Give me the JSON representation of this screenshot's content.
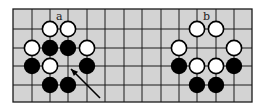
{
  "diagram": {
    "type": "go-board",
    "board": {
      "x0": 13,
      "y0": 9,
      "x1": 252,
      "y1": 102,
      "color": "#d3d3d3",
      "line_color": "#1a1a1a"
    },
    "vlines": [
      32,
      50,
      68,
      87,
      105,
      124,
      142,
      161,
      179,
      197,
      216,
      234
    ],
    "hlines": [
      29,
      48,
      66,
      85
    ],
    "labels": [
      {
        "text": "a",
        "x": 56,
        "y": 20
      },
      {
        "text": "b",
        "x": 203,
        "y": 20
      }
    ],
    "stones": {
      "white": [
        [
          50,
          29
        ],
        [
          68,
          29
        ],
        [
          32,
          48
        ],
        [
          87,
          48
        ],
        [
          50,
          66
        ],
        [
          197,
          29
        ],
        [
          216,
          29
        ],
        [
          179,
          48
        ],
        [
          234,
          48
        ],
        [
          197,
          66
        ],
        [
          216,
          66
        ]
      ],
      "black": [
        [
          50,
          48
        ],
        [
          68,
          48
        ],
        [
          32,
          66
        ],
        [
          87,
          66
        ],
        [
          50,
          85
        ],
        [
          68,
          85
        ],
        [
          179,
          66
        ],
        [
          234,
          66
        ],
        [
          197,
          85
        ],
        [
          216,
          85
        ]
      ]
    },
    "arrow": {
      "from": [
        100,
        98
      ],
      "to": [
        71,
        69
      ]
    }
  }
}
